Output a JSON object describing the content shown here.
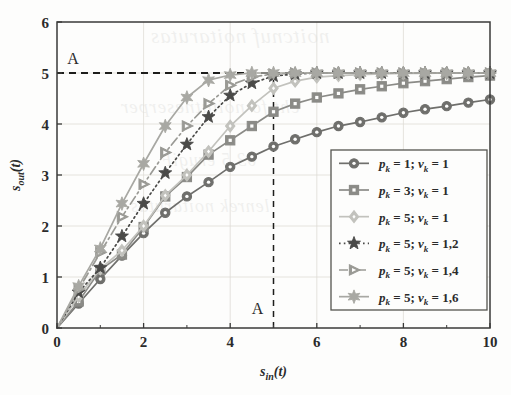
{
  "figure": {
    "kind": "line-plot",
    "background_color": "#fdfdfc",
    "axis_color": "#3a3a38",
    "grid_color": "#dedcd6"
  },
  "annotations": {
    "top_label": "A",
    "bottom_label": "A",
    "h_dash_value": 5,
    "v_dash_value": 5
  },
  "bleed_text": {
    "line1": "noitcnuf noitarutas",
    "line2": "eht fo noitatneserper",
    "line3": "03.5 erugiF",
    "line4": "lenrek noitarutas"
  },
  "chart_data": {
    "type": "line",
    "title": "",
    "subtitle": "",
    "xlabel": "s_in(t)",
    "ylabel": "s_out(t)",
    "xlabel_base": "s",
    "xlabel_sub": "in",
    "xlabel_tail": "(t)",
    "ylabel_base": "s",
    "ylabel_sub": "out",
    "ylabel_tail": "(t)",
    "xlim": [
      0,
      10
    ],
    "ylim": [
      0,
      6
    ],
    "xticks": [
      0,
      2,
      4,
      6,
      8,
      10
    ],
    "yticks": [
      0,
      1,
      2,
      3,
      4,
      5,
      6
    ],
    "xtick_labels": [
      "0",
      "2",
      "4",
      "6",
      "8",
      "10"
    ],
    "ytick_labels": [
      "0",
      "1",
      "2",
      "3",
      "4",
      "5",
      "6"
    ],
    "minor_xticks": [
      1,
      3,
      5,
      7,
      9
    ],
    "grid": true,
    "legend_position": "lower-right",
    "x": [
      0,
      0.5,
      1,
      1.5,
      2,
      2.5,
      3,
      3.5,
      4,
      4.5,
      5,
      5.5,
      6,
      6.5,
      7,
      7.5,
      8,
      8.5,
      9,
      9.5,
      10
    ],
    "series": [
      {
        "name": "p_k = 1; v_k = 1",
        "label_p": "1",
        "label_v": "1",
        "marker": "circle",
        "linestyle": "solid",
        "color": "#6f6f6c",
        "values": [
          0,
          0.48,
          0.96,
          1.42,
          1.86,
          2.26,
          2.58,
          2.86,
          3.16,
          3.36,
          3.56,
          3.7,
          3.84,
          3.96,
          4.04,
          4.13,
          4.22,
          4.29,
          4.35,
          4.42,
          4.48
        ]
      },
      {
        "name": "p_k = 3; v_k = 1",
        "label_p": "3",
        "label_v": "1",
        "marker": "square",
        "linestyle": "solid",
        "color": "#8b8b87",
        "values": [
          0,
          0.52,
          1.14,
          1.44,
          1.98,
          2.58,
          2.96,
          3.4,
          3.68,
          3.96,
          4.24,
          4.4,
          4.52,
          4.6,
          4.68,
          4.74,
          4.8,
          4.84,
          4.88,
          4.92,
          4.95
        ]
      },
      {
        "name": "p_k = 5; v_k = 1",
        "label_p": "5",
        "label_v": "1",
        "marker": "diamond",
        "linestyle": "solid",
        "color": "#c2c2bd",
        "values": [
          0,
          0.62,
          1.16,
          1.52,
          2.0,
          2.6,
          3.0,
          3.46,
          3.96,
          4.36,
          4.7,
          4.84,
          4.92,
          4.95,
          4.97,
          4.98,
          4.99,
          4.99,
          5.0,
          5.0,
          5.0
        ]
      },
      {
        "name": "p_k = 5; v_k = 1,2",
        "label_p": "5",
        "label_v": "1,2",
        "marker": "star5",
        "linestyle": "dotted",
        "color": "#4a4a48",
        "values": [
          0,
          0.7,
          1.18,
          1.8,
          2.44,
          3.04,
          3.6,
          4.14,
          4.56,
          4.8,
          4.94,
          4.98,
          5.0,
          5.0,
          5.0,
          5.0,
          5.0,
          5.0,
          5.0,
          5.0,
          5.0
        ]
      },
      {
        "name": "p_k = 5; v_k = 1,4",
        "label_p": "5",
        "label_v": "1,4",
        "marker": "triangle-right",
        "linestyle": "dashdot",
        "color": "#9a9a95",
        "values": [
          0,
          0.76,
          1.48,
          2.18,
          2.82,
          3.44,
          3.96,
          4.4,
          4.76,
          4.92,
          4.98,
          5.0,
          5.0,
          5.0,
          5.0,
          5.0,
          5.0,
          5.0,
          5.0,
          5.0,
          5.0
        ]
      },
      {
        "name": "p_k = 5; v_k = 1,6",
        "label_p": "5",
        "label_v": "1,6",
        "marker": "star6",
        "linestyle": "solid",
        "color": "#a8a8a3",
        "values": [
          0,
          0.82,
          1.56,
          2.44,
          3.22,
          3.96,
          4.52,
          4.86,
          4.96,
          5.0,
          5.0,
          5.0,
          5.0,
          5.0,
          5.0,
          5.0,
          5.0,
          5.0,
          5.0,
          5.0,
          5.0
        ]
      }
    ],
    "legend_entries": [
      {
        "p": "1",
        "v": "1",
        "marker": "circle",
        "linestyle": "solid",
        "color": "#6f6f6c"
      },
      {
        "p": "3",
        "v": "1",
        "marker": "square",
        "linestyle": "solid",
        "color": "#8b8b87"
      },
      {
        "p": "5",
        "v": "1",
        "marker": "diamond",
        "linestyle": "solid",
        "color": "#c2c2bd"
      },
      {
        "p": "5",
        "v": "1,2",
        "marker": "star5",
        "linestyle": "dotted",
        "color": "#4a4a48"
      },
      {
        "p": "5",
        "v": "1,4",
        "marker": "triangle-right",
        "linestyle": "dashdot",
        "color": "#9a9a95"
      },
      {
        "p": "5",
        "v": "1,6",
        "marker": "star6",
        "linestyle": "solid",
        "color": "#a8a8a3"
      }
    ],
    "legend_symbols": {
      "p_symbol": "p",
      "v_symbol": "v",
      "sub_symbol": "k",
      "equals": "=",
      "semicolon": ";"
    }
  }
}
